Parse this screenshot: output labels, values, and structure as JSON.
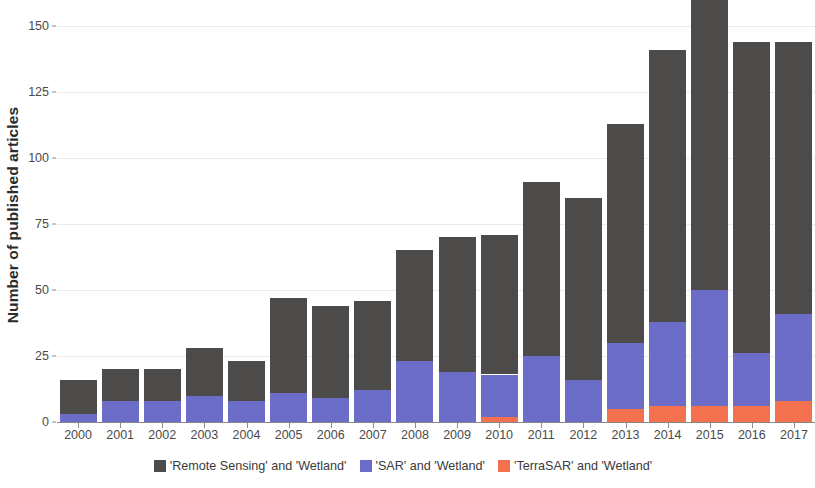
{
  "chart_data": {
    "type": "bar",
    "stacked": true,
    "title": "",
    "xlabel": "",
    "ylabel": "Number of published articles",
    "categories": [
      "2000",
      "2001",
      "2002",
      "2003",
      "2004",
      "2005",
      "2006",
      "2007",
      "2008",
      "2009",
      "2010",
      "2011",
      "2012",
      "2013",
      "2014",
      "2015",
      "2016",
      "2017"
    ],
    "series": [
      {
        "name": "'Remote Sensing' and 'Wetland'",
        "color": "#4d4a4a",
        "values": [
          13,
          12,
          12,
          18,
          15,
          36,
          35,
          34,
          42,
          51,
          53,
          66,
          69,
          83,
          103,
          112,
          118,
          103
        ]
      },
      {
        "name": "'SAR' and 'Wetland'",
        "color": "#6c6cc9",
        "values": [
          3,
          8,
          8,
          10,
          8,
          11,
          9,
          12,
          23,
          19,
          16,
          25,
          16,
          25,
          32,
          44,
          20,
          33
        ]
      },
      {
        "name": "'TerraSAR' and 'Wetland'",
        "color": "#f4714f",
        "values": [
          0,
          0,
          0,
          0,
          0,
          0,
          0,
          0,
          0,
          0,
          2,
          0,
          0,
          5,
          6,
          6,
          6,
          8
        ]
      }
    ],
    "totals": [
      16,
      20,
      20,
      28,
      23,
      47,
      44,
      46,
      65,
      70,
      71,
      91,
      85,
      113,
      141,
      162,
      144,
      144
    ],
    "yticks": [
      0,
      25,
      50,
      75,
      100,
      125,
      150
    ],
    "ytick_labels": [
      "0",
      "25",
      "50",
      "75",
      "100",
      "125",
      "150"
    ],
    "ylim": [
      0,
      165
    ],
    "grid": "horizontal",
    "legend_position": "bottom"
  },
  "legend": {
    "items": [
      {
        "label": "'Remote Sensing' and 'Wetland'",
        "color": "#4d4a4a"
      },
      {
        "label": "'SAR' and 'Wetland'",
        "color": "#6c6cc9"
      },
      {
        "label": "'TerraSAR' and 'Wetland'",
        "color": "#f4714f"
      }
    ]
  }
}
